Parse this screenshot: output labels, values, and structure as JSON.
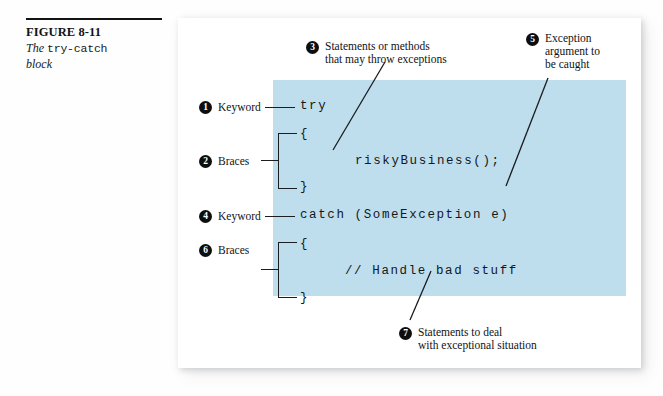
{
  "figure": {
    "number": "FIGURE 8-11",
    "caption_lead": "The ",
    "caption_mono": "try-catch",
    "caption_tail": "block"
  },
  "colors": {
    "panel_blue": "#bedeee",
    "ink": "#111315",
    "marker_fill": "#0c0e10",
    "page_white": "#ffffff"
  },
  "code": {
    "lines": [
      {
        "text": "try",
        "indent": 0
      },
      {
        "text": "{",
        "indent": 0
      },
      {
        "text": "riskyBusiness();",
        "indent": 1
      },
      {
        "text": "}",
        "indent": 0
      },
      {
        "text": "catch (SomeException e)",
        "indent": 0
      },
      {
        "text": "{",
        "indent": 0
      },
      {
        "text": "// Handle bad stuff",
        "indent": 1
      },
      {
        "text": "}",
        "indent": 0
      }
    ]
  },
  "callouts": [
    {
      "number": "1",
      "label": "Keyword",
      "target": "try"
    },
    {
      "number": "2",
      "label": "Braces",
      "target": "try-block-braces"
    },
    {
      "number": "3",
      "label_line1": "Statements or methods",
      "label_line2": "that may throw exceptions",
      "target": "riskyBusiness();"
    },
    {
      "number": "4",
      "label": "Keyword",
      "target": "catch"
    },
    {
      "number": "5",
      "label_line1": "Exception",
      "label_line2": "argument to",
      "label_line3": "be caught",
      "target": "SomeException e"
    },
    {
      "number": "6",
      "label": "Braces",
      "target": "catch-block-braces"
    },
    {
      "number": "7",
      "label_line1": "Statements to deal",
      "label_line2": "with exceptional situation",
      "target": "// Handle bad stuff"
    }
  ]
}
